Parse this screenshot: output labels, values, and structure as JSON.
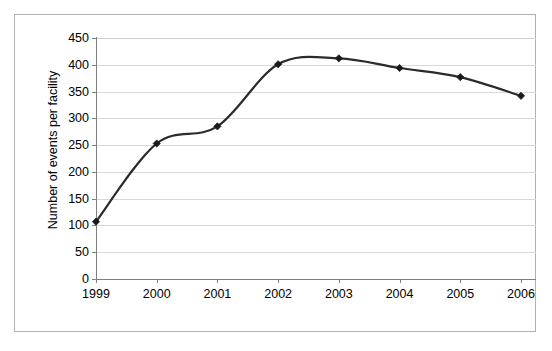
{
  "chart_data": {
    "type": "line",
    "title": "",
    "subtitle": "",
    "xlabel": "",
    "ylabel": "Number of events per facility",
    "categories": [
      "1999",
      "2000",
      "2001",
      "2002",
      "2003",
      "2004",
      "2005",
      "2006"
    ],
    "x": [
      1999,
      2000,
      2001,
      2002,
      2003,
      2004,
      2005,
      2006
    ],
    "values": [
      107,
      253,
      285,
      401,
      412,
      394,
      377,
      342
    ],
    "series": [
      {
        "name": "Number of events per facility",
        "values": [
          107,
          253,
          285,
          401,
          412,
          394,
          377,
          342
        ]
      }
    ],
    "ylim": [
      0,
      450
    ],
    "yticks": [
      0,
      50,
      100,
      150,
      200,
      250,
      300,
      350,
      400,
      450
    ],
    "ytick_labels": [
      "0",
      "50",
      "100",
      "150",
      "200",
      "250",
      "300",
      "350",
      "400",
      "450"
    ],
    "xtick_labels": [
      "1999",
      "2000",
      "2001",
      "2002",
      "2003",
      "2004",
      "2005",
      "2006"
    ],
    "grid": true,
    "grid_axis": "y",
    "legend": false,
    "legend_position": "none",
    "marker": "diamond",
    "line_color": "#2b2b2b",
    "marker_color": "#1a1a1a",
    "grid_color": "#d9d9d9",
    "axis_color": "#7f7f7f",
    "background_color": "#ffffff",
    "border_color": "#b0b0b0",
    "smoothed": true,
    "annotations": []
  }
}
